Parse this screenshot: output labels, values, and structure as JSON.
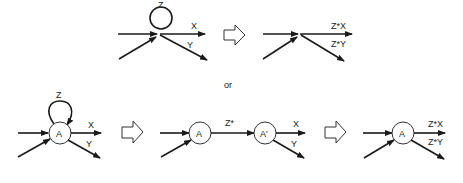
{
  "diagram": {
    "top": {
      "before": {
        "loop_label": "Z",
        "out_labels": [
          "X",
          "Y"
        ]
      },
      "after": {
        "out_labels": [
          "Z*X",
          "Z*Y"
        ]
      }
    },
    "separator": "or",
    "bottom": {
      "step1": {
        "node": "A",
        "loop_label": "Z",
        "out_labels": [
          "X",
          "Y"
        ]
      },
      "step2": {
        "node_a": "A",
        "edge_label": "Z*",
        "node_b": "A'",
        "out_labels": [
          "X",
          "Y"
        ]
      },
      "step3": {
        "node": "A",
        "out_labels": [
          "Z*X",
          "Z*Y"
        ]
      }
    }
  }
}
